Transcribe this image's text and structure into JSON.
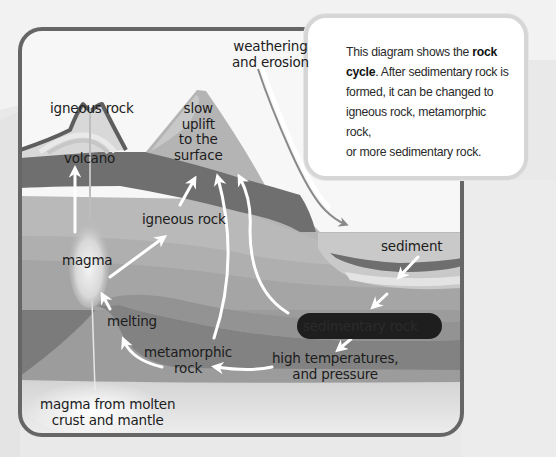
{
  "diagram": {
    "title": "rock cycle",
    "palette": {
      "frame": "#6a6a6a",
      "sky": "#f6f6f6",
      "dark_band": "#6e6e6e",
      "mid_layer": "#a9a9a9",
      "light_layer": "#bdbdbd",
      "metamorphic_band": "#838383",
      "sedimentary_pill": "#1e1e1e",
      "arrow": "#ffffff",
      "page_bg": "#f2f2f2"
    },
    "callout": {
      "line1_pre": "This diagram shows the ",
      "line1_bold": "rock",
      "line2_bold": "cycle",
      "line2_post": ". After sedimentary rock is",
      "line3": "formed, it can be changed to",
      "line4": "igneous rock, metamorphic rock,",
      "line5": "or more sedimentary rock."
    },
    "labels": {
      "weathering_1": "weathering",
      "weathering_2": "and erosion",
      "igneous_top": "igneous rock",
      "volcano": "volcano",
      "slow_1": "slow",
      "slow_2": "uplift",
      "slow_3": "to the",
      "slow_4": "surface",
      "igneous_mid": "igneous rock",
      "magma": "magma",
      "melting": "melting",
      "metamorphic_1": "metamorphic",
      "metamorphic_2": "rock",
      "sediment": "sediment",
      "sedimentary_rock": "sedimentary rock",
      "high_temp_1": "high temperatures,",
      "high_temp_2": "and pressure",
      "magma_source_1": "magma from molten",
      "magma_source_2": "crust and mantle"
    }
  }
}
